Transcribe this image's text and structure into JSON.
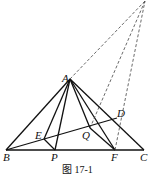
{
  "figure": {
    "caption": "图 17-1",
    "points": {
      "A": {
        "label": "A",
        "x": 70,
        "y": 79
      },
      "B": {
        "label": "B",
        "x": 6,
        "y": 150
      },
      "C": {
        "label": "C",
        "x": 144,
        "y": 150
      },
      "D": {
        "label": "D",
        "x": 117,
        "y": 118
      },
      "E": {
        "label": "E",
        "x": 44,
        "y": 139
      },
      "P": {
        "label": "P",
        "x": 55,
        "y": 150
      },
      "Q": {
        "label": "Q",
        "x": 90,
        "y": 128
      },
      "F": {
        "label": "F",
        "x": 115,
        "y": 150
      },
      "O": {
        "label": "",
        "x": 145,
        "y": 1
      }
    },
    "solid_segments": [
      "AB",
      "AC",
      "BC",
      "AE",
      "AP",
      "AQ",
      "AF",
      "BD",
      "EP",
      "QF"
    ],
    "dashed_segments": [
      "AO",
      "QO",
      "FO"
    ],
    "colors": {
      "stroke": "#111111",
      "background": "#ffffff"
    }
  }
}
